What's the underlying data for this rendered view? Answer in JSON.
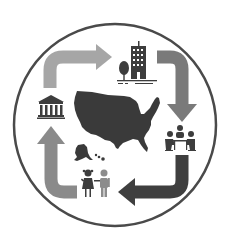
{
  "diagram": {
    "type": "cycle",
    "center": {
      "icon": "usa-map-icon",
      "label": ""
    },
    "nodes": [
      {
        "id": "business",
        "icon": "office-building-with-tree-icon",
        "position": "top-right"
      },
      {
        "id": "meeting",
        "icon": "people-meeting-table-icon",
        "position": "right"
      },
      {
        "id": "children",
        "icon": "children-icon",
        "position": "bottom"
      },
      {
        "id": "government",
        "icon": "government-building-icon",
        "position": "left"
      }
    ],
    "arrows": [
      {
        "from": "government",
        "to": "business",
        "color": "#a6a6a6"
      },
      {
        "from": "business",
        "to": "meeting",
        "color": "#7a7a7a"
      },
      {
        "from": "meeting",
        "to": "children",
        "color": "#3f3f3f"
      },
      {
        "from": "children",
        "to": "government",
        "color": "#8a8a8a"
      }
    ],
    "colors": {
      "ring": "#4a4a4a",
      "map": "#3a3a3a",
      "icons": "#3d3d3d",
      "child_boy": "#8c8c8c"
    }
  }
}
